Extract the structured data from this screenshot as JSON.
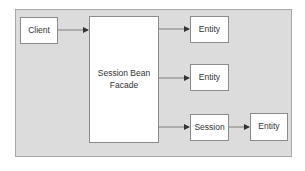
{
  "diagram": {
    "colors": {
      "background": "#dcdcdc",
      "box_fill": "#ffffff",
      "box_border": "#8c8c8c",
      "arrow": "#555555",
      "text": "#333333"
    },
    "nodes": {
      "client": {
        "label": "Client"
      },
      "facade": {
        "label": "Session Bean Facade",
        "line1": "Session Bean",
        "line2": "Facade"
      },
      "entity1": {
        "label": "Entity"
      },
      "entity2": {
        "label": "Entity"
      },
      "session": {
        "label": "Session"
      },
      "entity3": {
        "label": "Entity"
      }
    },
    "edges": [
      {
        "from": "Client",
        "to": "Session Bean Facade"
      },
      {
        "from": "Session Bean Facade",
        "to": "Entity (top)"
      },
      {
        "from": "Session Bean Facade",
        "to": "Entity (middle)"
      },
      {
        "from": "Session Bean Facade",
        "to": "Session"
      },
      {
        "from": "Session",
        "to": "Entity (bottom right)"
      }
    ]
  }
}
